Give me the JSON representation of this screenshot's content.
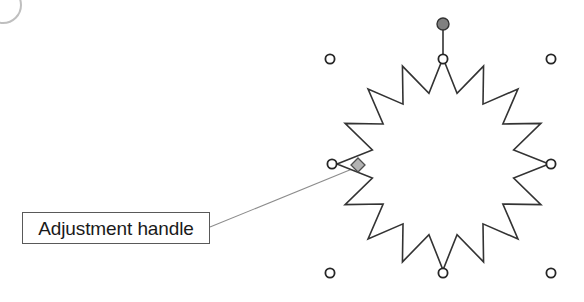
{
  "document": {
    "title": "Adjustment handle callout",
    "background_color": "#ffffff"
  },
  "callout": {
    "label": "Adjustment handle",
    "box": {
      "x": 22,
      "y": 212,
      "width": 188,
      "height": 32
    },
    "border_color": "#595959",
    "text_color": "#1a1a1a",
    "leader_line": {
      "from_x": 210,
      "from_y": 227,
      "to_x": 357,
      "to_y": 167,
      "color": "#8c8c8c"
    }
  },
  "shape": {
    "name": "16-point star explosion",
    "points": 16,
    "center_x": 443,
    "center_y": 164,
    "outer_radius": 106,
    "inner_radius": 72,
    "outline_color": "#333333",
    "fill_color": "#ffffff",
    "stroke_width": 1.6
  },
  "selection": {
    "handle_fill": "#ffffff",
    "handle_stroke": "#262626",
    "handle_radius": 4.6,
    "sizing_handles": [
      {
        "name": "top-left",
        "x": 330,
        "y": 59
      },
      {
        "name": "top-center",
        "x": 443,
        "y": 59
      },
      {
        "name": "top-right",
        "x": 551,
        "y": 59
      },
      {
        "name": "middle-left",
        "x": 332,
        "y": 164
      },
      {
        "name": "middle-right",
        "x": 551,
        "y": 164
      },
      {
        "name": "bottom-left",
        "x": 330,
        "y": 273
      },
      {
        "name": "bottom-center",
        "x": 443,
        "y": 273
      },
      {
        "name": "bottom-right",
        "x": 551,
        "y": 273
      }
    ],
    "rotation_handle": {
      "x": 443,
      "y": 24,
      "radius": 6,
      "fill": "#808080",
      "stroke": "#333333",
      "stem_from_y": 59,
      "stem_to_y": 30
    },
    "adjustment_handle": {
      "x": 358,
      "y": 165,
      "half_size": 7,
      "fill": "#b3b3b3",
      "stroke": "#4d4d4d"
    }
  },
  "corner_badge": {
    "x": -16,
    "y": -14,
    "size": 34,
    "border_color": "#8c8c8c"
  }
}
